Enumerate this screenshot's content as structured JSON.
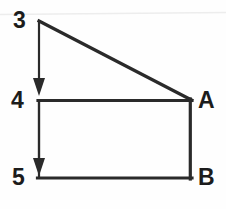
{
  "figure": {
    "background_color": "#fefefe",
    "stroke_color": "#2a2a2a",
    "stroke_width": 3,
    "faint_rule_color": "#ededed",
    "labels": {
      "top": "3",
      "middle": "4",
      "bottom": "5",
      "corner_right_top": "A",
      "corner_right_bottom": "B"
    },
    "geometry": {
      "apex": [
        39,
        21
      ],
      "left_mid": [
        39,
        100
      ],
      "left_bottom": [
        39,
        178
      ],
      "right_mid": [
        191,
        100
      ],
      "right_bottom": [
        191,
        178
      ]
    },
    "arrows": [
      {
        "name": "arrow-3-to-4",
        "from": [
          39,
          21
        ],
        "to": [
          39,
          96
        ]
      },
      {
        "name": "arrow-4-to-5",
        "from": [
          39,
          100
        ],
        "to": [
          39,
          176
        ]
      }
    ],
    "segments": [
      {
        "name": "hypotenuse",
        "from": [
          39,
          21
        ],
        "to": [
          191,
          100
        ]
      },
      {
        "name": "middle-horizontal",
        "from": [
          39,
          100
        ],
        "to": [
          192,
          100
        ]
      },
      {
        "name": "right-vertical",
        "from": [
          190,
          100
        ],
        "to": [
          190,
          178
        ]
      },
      {
        "name": "bottom-horizontal",
        "from": [
          38,
          178
        ],
        "to": [
          191,
          178
        ]
      }
    ]
  }
}
